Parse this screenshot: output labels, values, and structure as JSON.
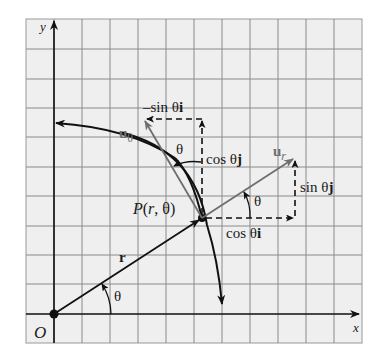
{
  "figure": {
    "type": "polar-unit-vectors-diagram",
    "colors": {
      "grid_background": "#efefef",
      "grid_line": "#8a8a8a",
      "axis": "#111111",
      "unit_vector": "#6e6e6e",
      "dashed": "#111111"
    },
    "grid": {
      "columns": 12,
      "rows": 11
    },
    "axes": {
      "x_label": "x",
      "y_label": "y",
      "origin_label": "O"
    },
    "point": {
      "label": "P(r, θ)",
      "label_parts": {
        "P": "P",
        "open": "(",
        "r": "r",
        "comma": ", ",
        "theta": "θ",
        "close": ")"
      }
    },
    "vectors": {
      "position": {
        "label": "r"
      },
      "u_r": {
        "base": "u",
        "sub": "r"
      },
      "u_theta": {
        "base": "u",
        "sub": "θ"
      }
    },
    "components": {
      "cos_i": {
        "coef": "cos θ",
        "unit": "i"
      },
      "sin_j": {
        "coef": "sin θ",
        "unit": "j"
      },
      "neg_sin_i": {
        "coef": "–sin θ",
        "unit": "i"
      },
      "cos_j": {
        "coef": "cos θ",
        "unit": "j"
      }
    },
    "angles": {
      "origin_angle": "θ",
      "ur_angle": "θ",
      "utheta_angle": "θ"
    }
  }
}
